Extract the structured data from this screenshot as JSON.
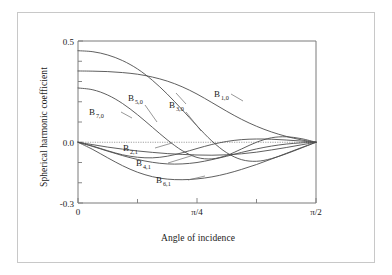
{
  "figure": {
    "background_color": "#ffffff",
    "frame_color": "#c8c8c8",
    "axis_color": "#7a7a7a",
    "curve_color": "#4d4d4d"
  },
  "chart_data": {
    "type": "line",
    "title": "",
    "xlabel": "Angle of incidence",
    "ylabel": "Spherical harmonic coefficient",
    "xlim": [
      0,
      1.5707963
    ],
    "ylim": [
      -0.3,
      0.5
    ],
    "grid": false,
    "zero_line": true,
    "legend_position": "inline-labels",
    "xticks": [
      0,
      0.3926991,
      0.7853982,
      1.1780972,
      1.5707963
    ],
    "xticklabels": [
      "0",
      "",
      "π/4",
      "",
      "π/2"
    ],
    "xtick_major_labels": [
      "0",
      "π/4",
      "π/2"
    ],
    "yticks": [
      -0.3,
      -0.2,
      -0.1,
      0.0,
      0.1,
      0.2,
      0.3,
      0.4,
      0.5
    ],
    "yticklabels": [
      "-0.3",
      "",
      "",
      "0.0",
      "",
      "",
      "",
      "",
      "0.5"
    ],
    "ytick_major_labels": [
      "0.5",
      "0.0",
      "-0.3"
    ],
    "series": [
      {
        "name": "B 1,0",
        "label_base": "B",
        "label_sub": "1,0",
        "x": [
          0.0,
          0.0982,
          0.1963,
          0.2945,
          0.3927,
          0.4909,
          0.589,
          0.6872,
          0.7854,
          0.8836,
          0.9817,
          1.0799,
          1.1781,
          1.2763,
          1.3744,
          1.4726,
          1.5708
        ],
        "y": [
          0.352,
          0.351,
          0.349,
          0.344,
          0.336,
          0.322,
          0.302,
          0.274,
          0.238,
          0.196,
          0.153,
          0.113,
          0.079,
          0.051,
          0.029,
          0.012,
          0.0
        ]
      },
      {
        "name": "B 3,0",
        "label_base": "B",
        "label_sub": "3,0",
        "x": [
          0.0,
          0.0982,
          0.1963,
          0.2945,
          0.3927,
          0.4909,
          0.589,
          0.6872,
          0.7854,
          0.8836,
          0.9817,
          1.0799,
          1.1781,
          1.2763,
          1.3744,
          1.4726,
          1.5708
        ],
        "y": [
          0.452,
          0.447,
          0.431,
          0.403,
          0.362,
          0.306,
          0.238,
          0.161,
          0.081,
          0.006,
          -0.052,
          -0.086,
          -0.094,
          -0.081,
          -0.057,
          -0.029,
          0.0
        ]
      },
      {
        "name": "B 5,0",
        "label_base": "B",
        "label_sub": "5,0",
        "x": [
          0.0,
          0.0982,
          0.1963,
          0.2945,
          0.3927,
          0.4909,
          0.589,
          0.6872,
          0.7854,
          0.8836,
          0.9817,
          1.0799,
          1.1781,
          1.2763,
          1.3744,
          1.4726,
          1.5708
        ],
        "y": [
          0.268,
          0.259,
          0.233,
          0.191,
          0.136,
          0.074,
          0.012,
          -0.041,
          -0.075,
          -0.082,
          -0.065,
          -0.033,
          0.0,
          0.022,
          0.027,
          0.018,
          0.0
        ]
      },
      {
        "name": "B 7,0",
        "label_base": "B",
        "label_sub": "7,0",
        "x": [
          0.0,
          0.0982,
          0.1963,
          0.2945,
          0.3927,
          0.4909,
          0.589,
          0.6872,
          0.7854,
          0.8836,
          0.9817,
          1.0799,
          1.1781,
          1.2763,
          1.3744,
          1.4726,
          1.5708
        ],
        "y": [
          0.0,
          -0.019,
          -0.042,
          -0.062,
          -0.074,
          -0.077,
          -0.069,
          -0.052,
          -0.031,
          -0.011,
          0.004,
          0.013,
          0.016,
          0.015,
          0.011,
          0.006,
          0.0
        ]
      },
      {
        "name": "B 2,1",
        "label_base": "B",
        "label_sub": "2,1",
        "x": [
          0.0,
          0.0982,
          0.1963,
          0.2945,
          0.3927,
          0.4909,
          0.589,
          0.6872,
          0.7854,
          0.8836,
          0.9817,
          1.0799,
          1.1781,
          1.2763,
          1.3744,
          1.4726,
          1.5708
        ],
        "y": [
          0.0,
          -0.012,
          -0.024,
          -0.034,
          -0.043,
          -0.05,
          -0.056,
          -0.06,
          -0.063,
          -0.064,
          -0.062,
          -0.057,
          -0.049,
          -0.038,
          -0.026,
          -0.013,
          0.0
        ]
      },
      {
        "name": "B 4,1",
        "label_base": "B",
        "label_sub": "4,1",
        "x": [
          0.0,
          0.0982,
          0.1963,
          0.2945,
          0.3927,
          0.4909,
          0.589,
          0.6872,
          0.7854,
          0.8836,
          0.9817,
          1.0799,
          1.1781,
          1.2763,
          1.3744,
          1.4726,
          1.5708
        ],
        "y": [
          0.0,
          -0.021,
          -0.044,
          -0.066,
          -0.085,
          -0.099,
          -0.107,
          -0.107,
          -0.1,
          -0.086,
          -0.069,
          -0.05,
          -0.033,
          -0.019,
          -0.009,
          -0.003,
          0.0
        ]
      },
      {
        "name": "B 6,1",
        "label_base": "B",
        "label_sub": "6,1",
        "x": [
          0.0,
          0.0982,
          0.1963,
          0.2945,
          0.3927,
          0.4909,
          0.589,
          0.6872,
          0.7854,
          0.8836,
          0.9817,
          1.0799,
          1.1781,
          1.2763,
          1.3744,
          1.4726,
          1.5708
        ],
        "y": [
          0.0,
          -0.036,
          -0.077,
          -0.116,
          -0.148,
          -0.17,
          -0.182,
          -0.185,
          -0.181,
          -0.171,
          -0.155,
          -0.134,
          -0.11,
          -0.083,
          -0.055,
          -0.027,
          0.0
        ]
      }
    ]
  },
  "labels": {
    "b10": {
      "base": "B",
      "sub": "1,0"
    },
    "b30": {
      "base": "B",
      "sub": "3,0"
    },
    "b50": {
      "base": "B",
      "sub": "5,0"
    },
    "b70": {
      "base": "B",
      "sub": "7,0"
    },
    "b21": {
      "base": "B",
      "sub": "2,1"
    },
    "b41": {
      "base": "B",
      "sub": "4,1"
    },
    "b61": {
      "base": "B",
      "sub": "6,1"
    }
  },
  "axes": {
    "y_top": "0.5",
    "y_zero": "0.0",
    "y_bottom": "-0.3",
    "x_left": "0",
    "x_mid": "π/4",
    "x_right": "π/2",
    "xlabel": "Angle of incidence",
    "ylabel": "Spherical harmonic coefficient"
  }
}
